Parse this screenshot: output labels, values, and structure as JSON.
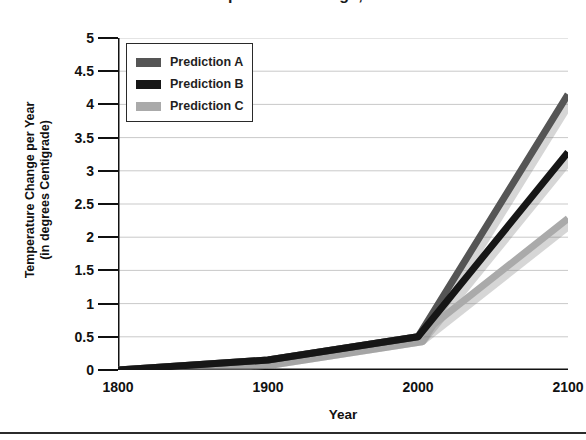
{
  "chart_data": {
    "type": "line",
    "title": "Global Temperature Change, 1800-2100",
    "xlabel": "Year",
    "ylabel": "Temperature Change per Year (in degrees Centigrade)",
    "ylabel_line1": "Temperature Change per Year",
    "ylabel_line2": "(in degrees Centigrade)",
    "x": [
      1800,
      1900,
      2000,
      2100
    ],
    "xlim": [
      1800,
      2100
    ],
    "ylim": [
      0,
      5
    ],
    "ytick_labels": [
      "5",
      "4.5",
      "4",
      "3.5",
      "3",
      "2.5",
      "2",
      "1.5",
      "1",
      "0.5",
      "0"
    ],
    "ytick_values": [
      5,
      4.5,
      4,
      3.5,
      3,
      2.5,
      2,
      1.5,
      1,
      0.5,
      0
    ],
    "xtick_labels": [
      "1800",
      "1900",
      "2000",
      "2100"
    ],
    "xtick_values": [
      1800,
      1900,
      2000,
      2100
    ],
    "grid": true,
    "grid_color": "#c9c9c9",
    "legend_position": "upper-left",
    "series": [
      {
        "name": "Prediction A",
        "color": "#555555",
        "values": [
          0.0,
          0.15,
          0.5,
          4.15
        ]
      },
      {
        "name": "Prediction B",
        "color": "#161616",
        "values": [
          0.0,
          0.15,
          0.5,
          3.28
        ]
      },
      {
        "name": "Prediction C",
        "color": "#aaaaaa",
        "values": [
          0.0,
          0.15,
          0.5,
          2.28
        ]
      }
    ]
  },
  "legend": {
    "items": [
      {
        "label": "Prediction A"
      },
      {
        "label": "Prediction B"
      },
      {
        "label": "Prediction C"
      }
    ]
  }
}
